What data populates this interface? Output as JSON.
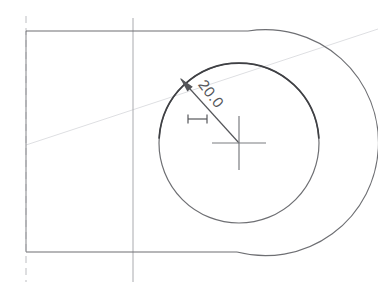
{
  "drawing": {
    "title": "CAD radial dimension view",
    "background_color": "#ffffff",
    "canvas": {
      "width": 378,
      "height": 293
    },
    "dimension": {
      "label": "20.0",
      "value": 20.0,
      "type": "radius",
      "text_rotation_deg": 52,
      "text_anchor": {
        "x": 207,
        "y": 97
      },
      "leader_line": {
        "from": {
          "x": 181,
          "y": 79
        },
        "to": {
          "x": 239,
          "y": 143
        }
      },
      "arrow_tip": {
        "x": 180,
        "y": 78
      },
      "arrow_name": "dimension-arrowhead"
    },
    "tick_marker": {
      "name": "scale-tick-marker",
      "x1": 188,
      "x2": 207,
      "y": 119,
      "cap_height": 9
    },
    "center_mark": {
      "name": "circle-center-cross",
      "cx": 239,
      "cy": 143,
      "half_width": 27,
      "half_height": 27
    },
    "inner_circle": {
      "name": "inner-bore-circle",
      "cx": 239,
      "cy": 143,
      "r": 80,
      "stroke": "#6e6f73"
    },
    "outer_profile": {
      "name": "outer-body-profile",
      "top_line": {
        "x1": 26,
        "y1": 31,
        "x2": 248,
        "y2": 31
      },
      "bottom_line": {
        "x1": 26,
        "y1": 252,
        "x2": 237,
        "y2": 252
      },
      "arc_radius": 113,
      "arc_center": {
        "x": 239,
        "y": 143
      },
      "stroke": "#6e6f73"
    },
    "left_edge": {
      "name": "left-body-edge",
      "x": 26,
      "y1": 31,
      "y2": 252,
      "stroke": "#9a9b9f"
    },
    "centerline_vertical_left": {
      "name": "centerline-vertical-left",
      "x": 26,
      "y_top": 16,
      "y_bottom": 282,
      "stroke": "#bcbdc1",
      "dash": "7 5"
    },
    "centerline_vertical_mid": {
      "name": "centerline-vertical-mid",
      "x": 133,
      "y_top": 18,
      "y_bottom": 282,
      "stroke": "#a9aaae"
    },
    "construction_diagonal": {
      "name": "construction-diagonal-line",
      "x1": 26,
      "y1": 145,
      "x2": 378,
      "y2": 29,
      "stroke": "#dedfe2"
    }
  }
}
